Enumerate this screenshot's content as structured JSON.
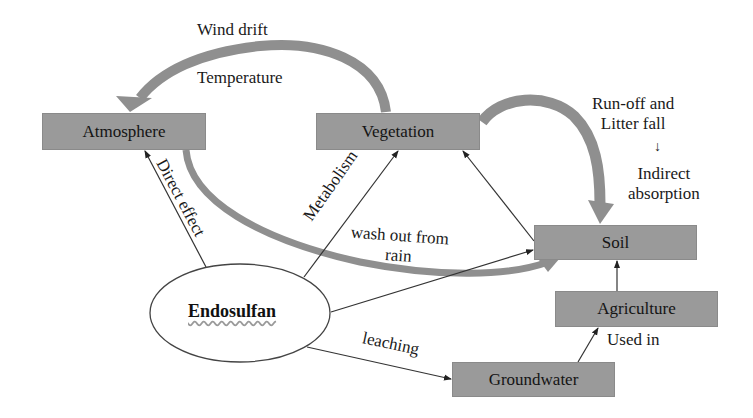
{
  "diagram": {
    "nodes": {
      "atmosphere": "Atmosphere",
      "vegetation": "Vegetation",
      "soil": "Soil",
      "agriculture": "Agriculture",
      "groundwater": "Groundwater",
      "endosulfan": "Endosulfan"
    },
    "edge_labels": {
      "wind_drift": "Wind drift",
      "temperature": "Temperature",
      "direct_effect": "Direct effect",
      "metabolism": "Metabolism",
      "wash_out_line1": "wash out from",
      "wash_out_line2": "rain",
      "leaching": "leaching",
      "used_in": "Used in",
      "runoff_line1": "Run-off and",
      "runoff_line2": "Litter fall",
      "runoff_arrow": "↓",
      "indirect_line1": "Indirect",
      "indirect_line2": "absorption"
    },
    "edges": [
      {
        "from": "Endosulfan",
        "to": "Atmosphere",
        "label": "Direct effect"
      },
      {
        "from": "Endosulfan",
        "to": "Vegetation",
        "label": "Metabolism"
      },
      {
        "from": "Endosulfan",
        "to": "Soil",
        "label": "wash out from rain"
      },
      {
        "from": "Endosulfan",
        "to": "Groundwater",
        "label": "leaching"
      },
      {
        "from": "Groundwater",
        "to": "Agriculture",
        "label": "Used in"
      },
      {
        "from": "Agriculture",
        "to": "Soil",
        "label": ""
      },
      {
        "from": "Soil",
        "to": "Vegetation",
        "label": ""
      },
      {
        "from": "Vegetation",
        "to": "Atmosphere",
        "label": "Wind drift / Temperature",
        "style": "thick-curved"
      },
      {
        "from": "Vegetation",
        "to": "Soil",
        "label": "Run-off and Litter fall → Indirect absorption",
        "style": "thick-curved"
      },
      {
        "from": "Atmosphere",
        "to": "Soil",
        "label": "",
        "style": "thick-curved"
      }
    ],
    "colors": {
      "box_fill": "#9a9a9a",
      "thick_arrow": "#8f8f8f",
      "thin_line": "#333333"
    }
  }
}
